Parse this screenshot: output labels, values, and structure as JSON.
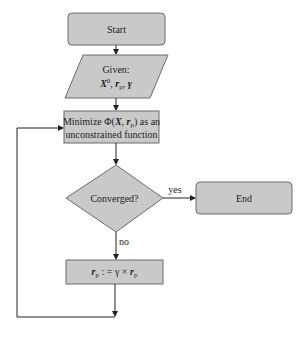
{
  "diagram": {
    "type": "flowchart",
    "nodes": {
      "start": {
        "label": "Start",
        "shape": "rounded-rectangle"
      },
      "given": {
        "line1": "Given:",
        "line2": "X⁰, rₚ, γ",
        "shape": "parallelogram",
        "parts": {
          "X": "X",
          "X_sup": "0",
          "sep1": ", ",
          "r": "r",
          "r_sub": "p",
          "sep2": ", ",
          "gamma": "γ"
        }
      },
      "minimize": {
        "line1_pre": "Minimize Φ(",
        "line1_X": "X",
        "line1_comma": ", ",
        "line1_r": "r",
        "line1_sub": "p",
        "line1_post": ") as an",
        "line2": "unconstrained function",
        "shape": "rectangle"
      },
      "converged": {
        "label": "Converged?",
        "shape": "diamond"
      },
      "end": {
        "label": "End",
        "shape": "rounded-rectangle"
      },
      "update": {
        "r": "r",
        "sub": "p",
        "mid": " : = γ × ",
        "r2": "r",
        "sub2": "p",
        "shape": "rectangle"
      }
    },
    "edges": [
      {
        "from": "start",
        "to": "given",
        "label": ""
      },
      {
        "from": "given",
        "to": "minimize",
        "label": ""
      },
      {
        "from": "minimize",
        "to": "converged",
        "label": ""
      },
      {
        "from": "converged",
        "to": "end",
        "label": "yes"
      },
      {
        "from": "converged",
        "to": "update",
        "label": "no"
      },
      {
        "from": "update",
        "to": "minimize",
        "label": ""
      }
    ],
    "colors": {
      "fill": "#c9c9c9",
      "stroke": "#6b6b6b",
      "edge": "#222222"
    }
  }
}
